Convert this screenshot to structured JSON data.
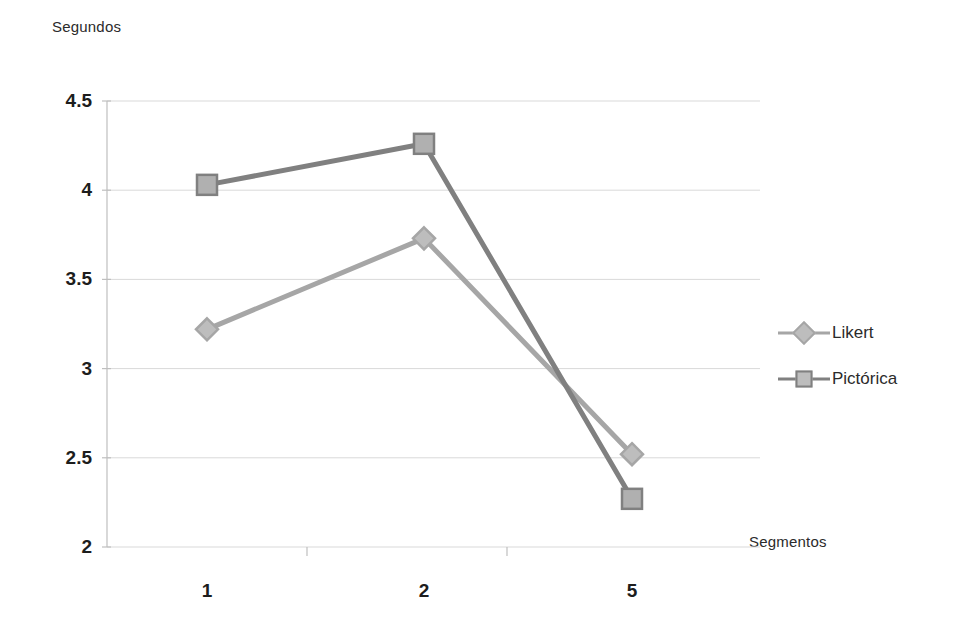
{
  "chart_data": {
    "type": "line",
    "title": "",
    "xlabel": "Segmentos",
    "ylabel": "Segundos",
    "categories": [
      "1",
      "2",
      "5"
    ],
    "x_tick_labels": [
      "1",
      "2",
      "5"
    ],
    "y_tick_labels": [
      "2",
      "2.5",
      "3",
      "3.5",
      "4",
      "4.5"
    ],
    "ylim": [
      2,
      4.5
    ],
    "y_tick_step": 0.5,
    "grid": "horizontal",
    "legend_position": "right",
    "series": [
      {
        "name": "Likert",
        "marker": "diamond",
        "color": "#a6a6a6",
        "values": [
          3.22,
          3.73,
          2.52
        ]
      },
      {
        "name": "Pictórica",
        "marker": "square",
        "color": "#808080",
        "values": [
          4.03,
          4.26,
          2.27
        ]
      }
    ]
  },
  "axes": {
    "y_title": "Segundos",
    "x_title": "Segmentos"
  },
  "legend": {
    "items": [
      {
        "label": "Likert",
        "marker": "diamond-icon",
        "color": "#a6a6a6"
      },
      {
        "label": "Pictórica",
        "marker": "square-icon",
        "color": "#808080"
      }
    ]
  },
  "ticks": {
    "y": [
      {
        "label": "4.5",
        "value": 4.5
      },
      {
        "label": "4",
        "value": 4
      },
      {
        "label": "3.5",
        "value": 3.5
      },
      {
        "label": "3",
        "value": 3
      },
      {
        "label": "2.5",
        "value": 2.5
      },
      {
        "label": "2",
        "value": 2
      }
    ],
    "x": [
      {
        "label": "1"
      },
      {
        "label": "2"
      },
      {
        "label": "5"
      }
    ]
  },
  "colors": {
    "grid": "#d9d9d9",
    "axis": "#bfbfbf",
    "text": "#231f20",
    "series_likert": "#a6a6a6",
    "series_pictorica": "#808080"
  }
}
